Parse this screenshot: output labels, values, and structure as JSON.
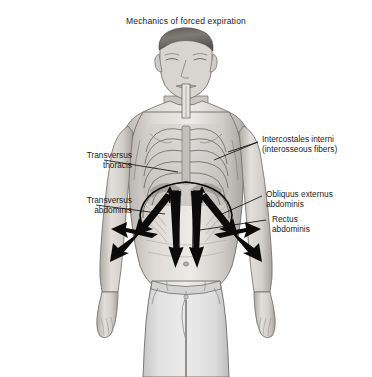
{
  "figure": {
    "title": "Mechanics of forced expiration",
    "background_color": "#ffffff",
    "text_color": "#1b1b1b",
    "line_color": "#111111"
  },
  "labels": [
    {
      "id": "intercostales-interni",
      "side": "right",
      "line1": "Intercostales interni",
      "line2": "(interosseous fibers)"
    },
    {
      "id": "transversus-thoracis",
      "side": "left",
      "line1": "Transversus",
      "line2": "thoracis"
    },
    {
      "id": "transversus-abdominis",
      "side": "left",
      "line1": "Transversus",
      "line2": "abdominis"
    },
    {
      "id": "obliquus-externus-abdominis",
      "side": "right",
      "line1": "Obliquus externus",
      "line2": "abdominis"
    },
    {
      "id": "rectus-abdominis",
      "side": "right",
      "line1": "Rectus",
      "line2": "abdominis"
    }
  ],
  "subject": {
    "description": "anterior view of a standing man, torso skin rendered translucent to reveal rib cage, diaphragm and abdominal musculature",
    "pose": "standing, arms at sides, eyes closed, mouthpiece at lips",
    "clothing": "light gray trousers",
    "skin_tone": "#d5d2cd",
    "trouser_tone": "#d9d9d9"
  },
  "force_arrows": {
    "description": "black arrows indicating direction of muscular force during forced expiration",
    "central_vertical_count": 2,
    "central_direction": "downward",
    "diagonal_inward_count": 4,
    "lateral_outward_count": 2,
    "costal_arc": "arc across the lower rib margin with small upward arrows beneath"
  }
}
